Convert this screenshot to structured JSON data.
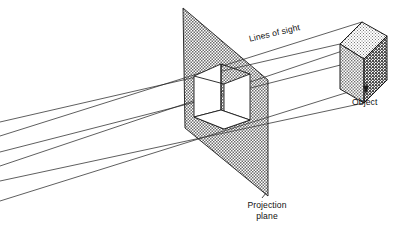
{
  "figure": {
    "labels": {
      "lines_of_sight": "Lines of sight",
      "object": "Object",
      "projection_plane_line1": "Projection",
      "projection_plane_line2": "plane"
    },
    "colors": {
      "stroke": "#1a1a1a",
      "background": "#ffffff",
      "plane_fill": "#b9b9b9",
      "projection_window_fill": "#ffffff",
      "cube_top_fill": "#e8e8e8",
      "cube_left_fill": "#c9c9c9",
      "cube_right_fill": "#a0a0a0"
    },
    "geometry": {
      "projection_plane_vertices": [
        [
          183,
          8
        ],
        [
          268,
          80
        ],
        [
          268,
          196
        ],
        [
          185,
          128
        ]
      ],
      "projection_window_vertices": [
        [
          194,
          117
        ],
        [
          194,
          76
        ],
        [
          221,
          64
        ],
        [
          221,
          110
        ]
      ],
      "projection_window_back_vertices": [
        [
          224,
          129
        ],
        [
          224,
          84
        ],
        [
          250,
          74
        ],
        [
          250,
          120
        ]
      ],
      "cube_top_face": [
        [
          340,
          44
        ],
        [
          362,
          22
        ],
        [
          387,
          36
        ],
        [
          364,
          59
        ]
      ],
      "cube_left_face": [
        [
          340,
          44
        ],
        [
          364,
          59
        ],
        [
          364,
          103
        ],
        [
          340,
          89
        ]
      ],
      "cube_right_face": [
        [
          364,
          59
        ],
        [
          387,
          36
        ],
        [
          387,
          80
        ],
        [
          364,
          103
        ]
      ],
      "lines_of_sight_count": 6,
      "lines_of_sight": [
        {
          "from": [
            0,
            122
          ],
          "to": [
            340,
            44
          ]
        },
        {
          "from": [
            0,
            136
          ],
          "to": [
            362,
            22
          ]
        },
        {
          "from": [
            0,
            152
          ],
          "to": [
            364,
            59
          ]
        },
        {
          "from": [
            0,
            166
          ],
          "to": [
            387,
            36
          ]
        },
        {
          "from": [
            0,
            181
          ],
          "to": [
            364,
            103
          ]
        },
        {
          "from": [
            0,
            201
          ],
          "to": [
            387,
            80
          ]
        }
      ],
      "object_leader": {
        "from": [
          366,
          95
        ],
        "to": [
          366,
          80
        ]
      },
      "plane_leader": {
        "from": [
          262,
          192
        ],
        "to": [
          268,
          196
        ]
      }
    }
  }
}
